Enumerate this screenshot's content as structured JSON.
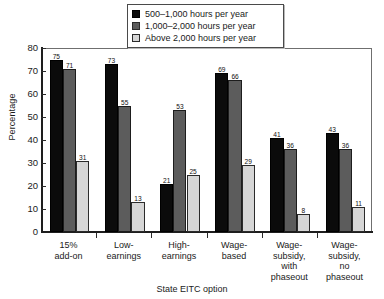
{
  "chart_data": {
    "type": "bar",
    "title": "",
    "xlabel": "State EITC option",
    "ylabel": "Percentage",
    "ylim": [
      0,
      80
    ],
    "yticks": [
      0,
      10,
      20,
      30,
      40,
      50,
      60,
      70,
      80
    ],
    "grid": false,
    "legend_position": "top-center",
    "categories": [
      "15%\nadd-on",
      "Low-\nearnings",
      "High-\nearnings",
      "Wage-\nbased",
      "Wage-\nsubsidy,\nwith\nphaseout",
      "Wage-\nsubsidy,\nno\nphaseout"
    ],
    "category_lines": [
      [
        "15%",
        "add-on"
      ],
      [
        "Low-",
        "earnings"
      ],
      [
        "High-",
        "earnings"
      ],
      [
        "Wage-",
        "based"
      ],
      [
        "Wage-",
        "subsidy,",
        "with",
        "phaseout"
      ],
      [
        "Wage-",
        "subsidy,",
        "no",
        "phaseout"
      ]
    ],
    "series": [
      {
        "name": "500–1,000 hours per year",
        "color": "#0b0b0b",
        "values": [
          75,
          71,
          21,
          69,
          41,
          43
        ]
      },
      {
        "name": "1,000–2,000 hours per year",
        "color": "#5c5c5c",
        "values": [
          71,
          55,
          53,
          66,
          36,
          36
        ]
      },
      {
        "name": "Above 2,000 hours per year",
        "color": "#d6d6d6",
        "values": [
          31,
          13,
          25,
          29,
          8,
          11
        ]
      }
    ],
    "group_values": [
      [
        75,
        71,
        31
      ],
      [
        73,
        55,
        13
      ],
      [
        21,
        53,
        25
      ],
      [
        69,
        66,
        29
      ],
      [
        41,
        36,
        8
      ],
      [
        43,
        36,
        11
      ]
    ]
  },
  "legend": {
    "items": [
      "500–1,000 hours per year",
      "1,000–2,000 hours per year",
      "Above 2,000 hours per year"
    ]
  },
  "axes": {
    "y_title": "Percentage",
    "x_title": "State EITC option",
    "y_tick_labels": [
      "80",
      "70",
      "60",
      "50",
      "40",
      "30",
      "20",
      "10",
      "0"
    ]
  }
}
